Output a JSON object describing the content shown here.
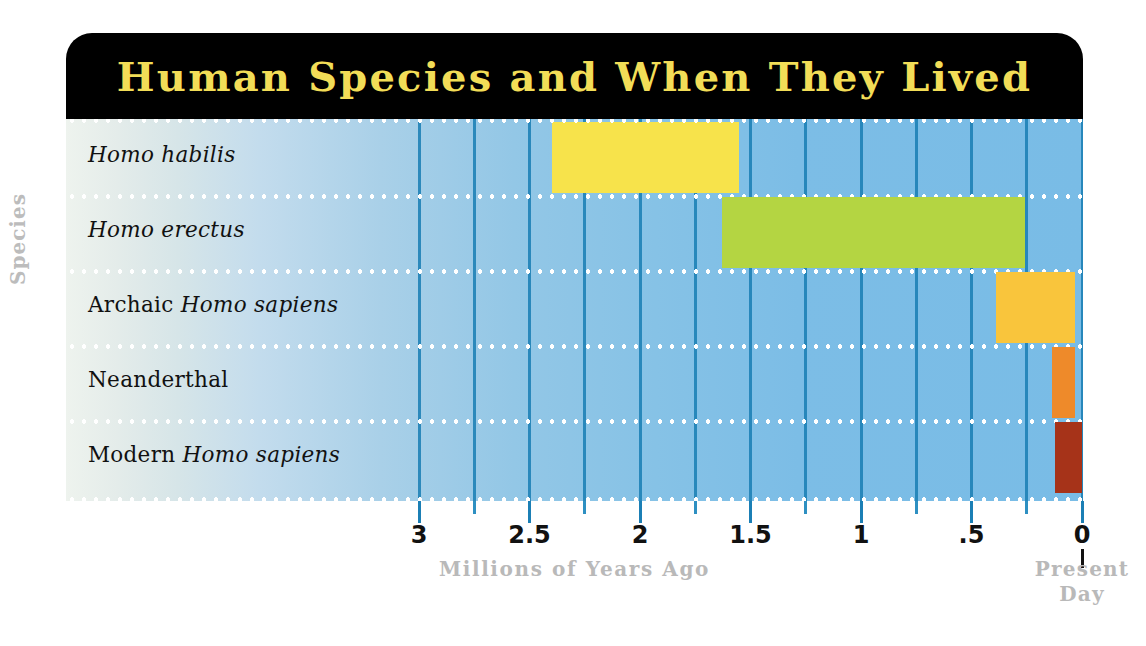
{
  "title": "Human Species and When They Lived",
  "colors": {
    "title_text": "#f2dd57",
    "title_background": "#000000",
    "gridline": "#1b7fb5",
    "row_separator": "#ffffff",
    "axis_label_gray": "#b9b9b9",
    "panel_left": "#eef3ee",
    "panel_right": "#79bce6",
    "habilis": "#f7e34b",
    "erectus": "#b4d542",
    "archaic": "#f9c53c",
    "neanderthal": "#ee8a2a",
    "modern": "#a63319"
  },
  "axis": {
    "ylabel": "Species",
    "xlabel": "Millions of Years Ago",
    "present_day_line1": "Present",
    "present_day_line2": "Day",
    "major_ticks": [
      "3",
      "2.5",
      "2",
      "1.5",
      "1",
      ".5",
      "0"
    ],
    "major_tick_values": [
      3,
      2.5,
      2,
      1.5,
      1,
      0.5,
      0
    ],
    "minor_tick_values": [
      2.75,
      2.25,
      1.75,
      1.25,
      0.75,
      0.25
    ],
    "xlim": [
      3.3,
      0
    ],
    "units": "millions of years ago"
  },
  "chart_data": {
    "type": "bar",
    "orientation": "horizontal-range",
    "title": "Human Species and When They Lived",
    "xlabel": "Millions of Years Ago",
    "ylabel": "Species",
    "xlim": [
      3.3,
      0
    ],
    "x_tick_labels": [
      "3",
      "2.5",
      "2",
      "1.5",
      "1",
      ".5",
      "0"
    ],
    "x_tick_values": [
      3,
      2.5,
      2,
      1.5,
      1,
      0.5,
      0
    ],
    "grid": "vertical",
    "legend": "none",
    "annotations": [
      "Present Day"
    ],
    "categories": [
      "Homo habilis",
      "Homo erectus",
      "Archaic Homo sapiens",
      "Neanderthal",
      "Modern Homo sapiens"
    ],
    "series": [
      {
        "name": "Homo habilis",
        "label_parts": [
          {
            "text": "Homo habilis",
            "style": "italic"
          }
        ],
        "start_mya": 2.4,
        "end_mya": 1.55,
        "color": "#f7e34b"
      },
      {
        "name": "Homo erectus",
        "label_parts": [
          {
            "text": "Homo erectus",
            "style": "italic"
          }
        ],
        "start_mya": 1.63,
        "end_mya": 0.26,
        "color": "#b4d542"
      },
      {
        "name": "Archaic Homo sapiens",
        "label_parts": [
          {
            "text": "Archaic ",
            "style": "roman"
          },
          {
            "text": "Homo sapiens",
            "style": "italic"
          }
        ],
        "start_mya": 0.39,
        "end_mya": 0.03,
        "color": "#f9c53c"
      },
      {
        "name": "Neanderthal",
        "label_parts": [
          {
            "text": "Neanderthal",
            "style": "roman"
          }
        ],
        "start_mya": 0.135,
        "end_mya": 0.03,
        "color": "#ee8a2a"
      },
      {
        "name": "Modern Homo sapiens",
        "label_parts": [
          {
            "text": "Modern ",
            "style": "roman"
          },
          {
            "text": "Homo sapiens",
            "style": "italic"
          }
        ],
        "start_mya": 0.12,
        "end_mya": 0.0,
        "color": "#a63319"
      }
    ]
  }
}
